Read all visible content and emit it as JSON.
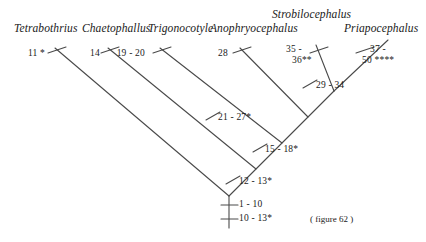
{
  "figure": {
    "caption": "( figure 62 )",
    "line_color": "#4a4a4a",
    "text_color": "#1a1a1a",
    "background": "#ffffff"
  },
  "taxa": [
    {
      "name": "Tetrabothrius",
      "x": 14,
      "y": 22
    },
    {
      "name": "Chaetophallus",
      "x": 82,
      "y": 22
    },
    {
      "name": "Trigonocotyle",
      "x": 148,
      "y": 22
    },
    {
      "name": "Anophryocephalus",
      "x": 210,
      "y": 22
    },
    {
      "name": "Strobilocephalus",
      "x": 272,
      "y": 8
    },
    {
      "name": "Priapocephalus",
      "x": 344,
      "y": 22
    }
  ],
  "branch_labels": [
    {
      "id": "t1",
      "text": "11 *",
      "x": 31,
      "y": 48,
      "align": "end"
    },
    {
      "id": "t2",
      "text": "14",
      "x": 100,
      "y": 48,
      "align": "end"
    },
    {
      "id": "t3",
      "text": "19 - 20",
      "x": 145,
      "y": 48,
      "align": "end"
    },
    {
      "id": "t4",
      "text": "28",
      "x": 228,
      "y": 48,
      "align": "end"
    },
    {
      "id": "t5a",
      "text": "35 -",
      "x": 286,
      "y": 44,
      "align": "start"
    },
    {
      "id": "t5b",
      "text": "36**",
      "x": 292,
      "y": 55,
      "align": "start"
    },
    {
      "id": "t6a",
      "text": "37 -",
      "x": 370,
      "y": 44,
      "align": "start"
    },
    {
      "id": "t6b",
      "text": "50 ****",
      "x": 362,
      "y": 55,
      "align": "start"
    },
    {
      "id": "n29",
      "text": "29 - 34",
      "x": 316,
      "y": 85,
      "align": "start"
    },
    {
      "id": "n21",
      "text": "21 - 27*",
      "x": 218,
      "y": 116,
      "align": "start"
    },
    {
      "id": "n15",
      "text": "15 - 18*",
      "x": 265,
      "y": 148,
      "align": "start"
    },
    {
      "id": "n12",
      "text": "12 - 13*",
      "x": 239,
      "y": 180,
      "align": "start"
    },
    {
      "id": "r1",
      "text": "1 - 10",
      "x": 239,
      "y": 202,
      "align": "start"
    },
    {
      "id": "r2",
      "text": "10 - 13*",
      "x": 239,
      "y": 216,
      "align": "start"
    }
  ],
  "tree_structure": {
    "type": "cladogram",
    "topology": "pectinate-ladder-with-terminal-sister-pair",
    "root_node": {
      "x": 229,
      "y": 196
    },
    "internal_nodes": [
      {
        "label": "12 - 13*",
        "x": 229,
        "y": 196
      },
      {
        "label": "15 - 18*",
        "x": 256,
        "y": 169
      },
      {
        "label": "21 - 27*",
        "x": 282,
        "y": 143
      },
      {
        "label": "29 - 34",
        "x": 308,
        "y": 117
      },
      {
        "label": "sister-pair-node",
        "x": 334,
        "y": 91
      }
    ]
  }
}
